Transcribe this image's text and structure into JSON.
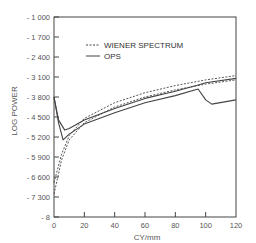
{
  "chart_data": {
    "type": "line",
    "title": "",
    "xlabel": "CY/mm",
    "ylabel": "LOG POWER",
    "xlim": [
      0,
      120
    ],
    "ylim": [
      1000,
      8000
    ],
    "y_inverted": true,
    "grid": false,
    "legend_position": "upper-left-inside",
    "x_ticks": [
      0,
      20,
      40,
      60,
      80,
      100,
      120
    ],
    "x_tick_labels": [
      "0",
      "20",
      "40",
      "60",
      "80",
      "100",
      "120"
    ],
    "y_ticks": [
      1000,
      1700,
      2400,
      3100,
      3800,
      4500,
      5200,
      5900,
      6600,
      7300,
      8000
    ],
    "y_tick_labels": [
      "- 1 000",
      "- 1 700",
      "- 2 400",
      "- 3 100",
      "- 3 800",
      "- 4 500",
      "- 5 200",
      "- 5 900",
      "- 6 600",
      "- 7 300",
      "- 8"
    ],
    "legend": [
      {
        "label": "WIENER SPECTRUM",
        "style": "dashed"
      },
      {
        "label": "OPS",
        "style": "solid"
      }
    ],
    "series": [
      {
        "name": "OPS (upper)",
        "style": "solid",
        "x": [
          0,
          3,
          7,
          10,
          20,
          40,
          60,
          80,
          95,
          100,
          120
        ],
        "y": [
          3800,
          4600,
          4950,
          4900,
          4600,
          4200,
          3850,
          3600,
          3380,
          3300,
          3150
        ]
      },
      {
        "name": "OPS (lower)",
        "style": "solid",
        "x": [
          0,
          3,
          6,
          10,
          20,
          40,
          60,
          80,
          95,
          100,
          104,
          120
        ],
        "y": [
          3800,
          4700,
          5300,
          5100,
          4750,
          4350,
          4000,
          3750,
          3520,
          3900,
          4050,
          3900
        ]
      },
      {
        "name": "WIENER SPECTRUM (upper)",
        "style": "dashed",
        "x": [
          0,
          5,
          10,
          20,
          40,
          60,
          80,
          100,
          120
        ],
        "y": [
          6800,
          5800,
          5150,
          4550,
          4000,
          3650,
          3400,
          3200,
          3050
        ]
      },
      {
        "name": "WIENER SPECTRUM (lower)",
        "style": "dashed",
        "x": [
          0,
          5,
          10,
          20,
          40,
          60,
          80,
          100,
          120
        ],
        "y": [
          7200,
          6000,
          5300,
          4700,
          4150,
          3800,
          3550,
          3350,
          3200
        ]
      }
    ]
  },
  "layout": {
    "plot_left": 54,
    "plot_right": 236,
    "plot_top": 17,
    "plot_bottom": 217,
    "line_color": "#444444"
  }
}
